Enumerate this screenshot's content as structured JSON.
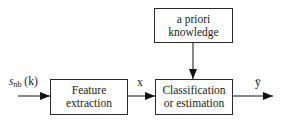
{
  "diagram": {
    "type": "block-diagram",
    "blocks": [
      {
        "id": "prior",
        "lines": [
          "a priori",
          "knowledge"
        ]
      },
      {
        "id": "feature",
        "lines": [
          "Feature",
          "extraction"
        ]
      },
      {
        "id": "classify",
        "lines": [
          "Classification",
          "or estimation"
        ]
      }
    ],
    "signals": {
      "input": {
        "symbol": "s",
        "subscript": "nb",
        "arg": "(k)"
      },
      "features": "x",
      "output": "ȳ"
    },
    "edges": [
      {
        "from": "input",
        "to": "feature"
      },
      {
        "from": "feature",
        "to": "classify",
        "label": "x"
      },
      {
        "from": "prior",
        "to": "classify"
      },
      {
        "from": "classify",
        "to": "output",
        "label": "ȳ"
      }
    ]
  }
}
